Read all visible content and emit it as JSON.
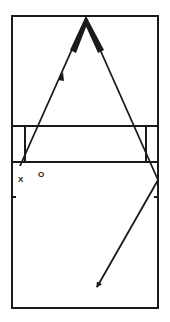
{
  "diagram": {
    "type": "volleyball-court-drill",
    "colors": {
      "line": "#1a1a1a",
      "background": "#ffffff"
    },
    "court": {
      "left": 12,
      "top": 16,
      "right": 158,
      "bottom": 308
    },
    "net_band": {
      "top": 126,
      "bottom": 162,
      "post_left_x": 25,
      "post_right_x": 146
    },
    "side_ticks_y": 197,
    "players": [
      {
        "id": "x",
        "label": "X",
        "x": 18,
        "y": 176
      },
      {
        "id": "o",
        "label": "O",
        "x": 38,
        "y": 171
      }
    ],
    "paths": [
      {
        "name": "left-pass-arrow",
        "from": [
          20,
          165
        ],
        "to": [
          86,
          18
        ]
      },
      {
        "name": "right-return-arrow",
        "from": [
          86,
          18
        ],
        "to": [
          158,
          180
        ]
      },
      {
        "name": "bounce-arrow",
        "from": [
          158,
          180
        ],
        "to": [
          96,
          288
        ]
      }
    ]
  }
}
